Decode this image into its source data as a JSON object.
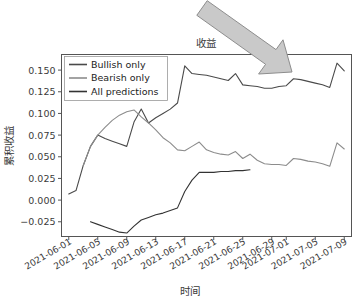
{
  "chart_data": {
    "type": "line",
    "title": "收益",
    "xlabel": "时间",
    "ylabel": "累积收益",
    "grid": false,
    "legend_position": "upper left",
    "ylim": [
      -0.042,
      0.168
    ],
    "yticks": [
      -0.025,
      0.0,
      0.025,
      0.05,
      0.075,
      0.1,
      0.125,
      0.15
    ],
    "ytick_labels": [
      "−0.025",
      "0.000",
      "0.025",
      "0.050",
      "0.075",
      "0.100",
      "0.125",
      "0.150"
    ],
    "xlim": [
      "2021-05-31",
      "2021-07-10"
    ],
    "xticks": [
      "2021-06-01",
      "2021-06-05",
      "2021-06-09",
      "2021-06-13",
      "2021-06-17",
      "2021-06-21",
      "2021-06-25",
      "2021-06-29",
      "2021-07-01",
      "2021-07-05",
      "2021-07-09"
    ],
    "x": [
      "2021-06-01",
      "2021-06-02",
      "2021-06-03",
      "2021-06-04",
      "2021-06-05",
      "2021-06-06",
      "2021-06-07",
      "2021-06-08",
      "2021-06-09",
      "2021-06-10",
      "2021-06-11",
      "2021-06-12",
      "2021-06-13",
      "2021-06-14",
      "2021-06-15",
      "2021-06-16",
      "2021-06-17",
      "2021-06-18",
      "2021-06-19",
      "2021-06-20",
      "2021-06-21",
      "2021-06-22",
      "2021-06-23",
      "2021-06-24",
      "2021-06-25",
      "2021-06-26",
      "2021-06-27",
      "2021-06-28",
      "2021-06-29",
      "2021-06-30",
      "2021-07-01",
      "2021-07-02",
      "2021-07-03",
      "2021-07-04",
      "2021-07-05",
      "2021-07-06",
      "2021-07-07",
      "2021-07-08",
      "2021-07-09"
    ],
    "series": [
      {
        "name": "Bullish only",
        "color": "#4a4a4a",
        "values": [
          0.007,
          0.011,
          0.04,
          0.062,
          0.075,
          0.071,
          0.068,
          0.065,
          0.062,
          0.09,
          0.105,
          0.089,
          0.095,
          0.1,
          0.105,
          0.112,
          0.155,
          0.146,
          0.145,
          0.144,
          0.142,
          0.14,
          0.138,
          0.146,
          0.133,
          0.132,
          0.131,
          0.129,
          0.129,
          0.131,
          0.132,
          0.14,
          0.139,
          0.137,
          0.135,
          0.133,
          0.13,
          0.158,
          0.149
        ]
      },
      {
        "name": "Bearish only",
        "color": "#8c8c8c",
        "values": [
          null,
          null,
          0.04,
          0.062,
          0.075,
          0.084,
          0.092,
          0.098,
          0.102,
          0.104,
          0.096,
          0.089,
          0.081,
          0.072,
          0.066,
          0.058,
          0.057,
          0.062,
          0.067,
          0.058,
          0.055,
          0.053,
          0.052,
          0.056,
          0.048,
          0.053,
          0.046,
          0.042,
          0.041,
          0.041,
          0.04,
          0.048,
          0.047,
          0.045,
          0.044,
          0.042,
          0.039,
          0.066,
          0.059
        ]
      },
      {
        "name": "All predictions",
        "color": "#333333",
        "values": [
          null,
          -0.011,
          null,
          -0.025,
          -0.028,
          -0.031,
          -0.034,
          -0.037,
          -0.038,
          -0.03,
          -0.023,
          -0.02,
          -0.017,
          -0.015,
          -0.012,
          -0.009,
          0.01,
          0.023,
          0.032,
          0.032,
          0.032,
          0.033,
          0.033,
          0.034,
          0.034,
          0.035,
          null,
          null,
          null,
          null,
          null,
          null,
          null,
          null,
          null,
          null,
          null,
          null,
          null
        ]
      }
    ],
    "annotations": [
      {
        "name": "pointer-arrow",
        "shape": "block-arrow",
        "from": [
          202,
          8
        ],
        "to": [
          292,
          72
        ],
        "fill": "#c9c9c9",
        "stroke": "#8d8d8d"
      }
    ]
  },
  "legend": {
    "entries": [
      {
        "label": "Bullish only"
      },
      {
        "label": "Bearish only"
      },
      {
        "label": "All predictions"
      }
    ]
  }
}
